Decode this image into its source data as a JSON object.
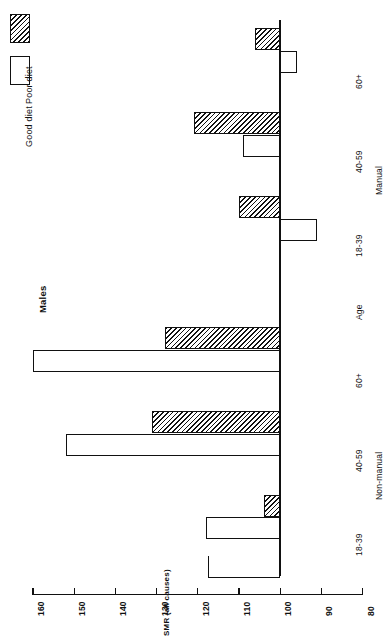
{
  "chart_title": "Males",
  "legend": {
    "position": "top-left",
    "entries": [
      {
        "label": "Good diet",
        "swatch": "open-white-rectangle"
      },
      {
        "label": "Poor diet",
        "swatch": "hatched-rectangle"
      }
    ]
  },
  "axis_title": "SMR (all causes)",
  "category_axis_label": "Age",
  "group_labels": [
    "Non-manual",
    "Manual"
  ],
  "chart_data": {
    "type": "bar",
    "title": "Males",
    "orientation": "horizontal-rotated",
    "xlabel": "Age",
    "ylabel": "SMR (all causes)",
    "ylim": [
      80,
      160
    ],
    "yticks": [
      160,
      150,
      140,
      130,
      120,
      110,
      100,
      90,
      80
    ],
    "baseline": 100,
    "grid": false,
    "legend_position": "top-left",
    "groups": [
      "Non-manual",
      "Manual"
    ],
    "categories": [
      "18-39",
      "40-59",
      "60+"
    ],
    "series": [
      {
        "name": "Good diet",
        "Non-manual": [
          118,
          152,
          160
        ],
        "Manual": [
          91,
          109,
          96
        ]
      },
      {
        "name": "Poor diet",
        "Non-manual": [
          104,
          131,
          128
        ],
        "Manual": [
          110,
          121,
          106
        ]
      }
    ]
  },
  "tick_labels": [
    "160",
    "150",
    "140",
    "130",
    "120",
    "110",
    "100",
    "90",
    "80"
  ],
  "category_labels_nonmanual": [
    "18-39",
    "40-59",
    "60+"
  ],
  "category_labels_manual": [
    "18-39",
    "40-59",
    "60+"
  ]
}
